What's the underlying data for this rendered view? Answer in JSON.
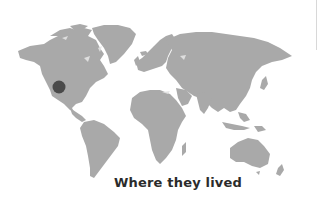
{
  "map": {
    "style": "grayscale world map",
    "land_color": "#a9a9a9",
    "land_shadow_color": "#8f8f8f",
    "ice_color": "#e4e4e4",
    "background_color": "#ffffff",
    "marker": {
      "label": "location marker",
      "region": "western North America",
      "color": "#4a4a4a",
      "x": 59,
      "y": 87,
      "radius": 6.5
    }
  },
  "caption": {
    "text": "Where they lived"
  }
}
